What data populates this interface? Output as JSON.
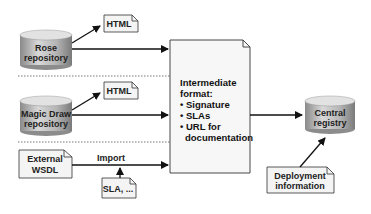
{
  "diagram": {
    "sources": [
      {
        "id": "rose",
        "line1": "Rose",
        "line2": "repository",
        "doc": "HTML"
      },
      {
        "id": "magicdraw",
        "line1": "Magic Draw",
        "line2": "repository",
        "doc": "HTML"
      },
      {
        "id": "external",
        "line1": "External",
        "line2": "WSDL"
      }
    ],
    "import_label": "Import",
    "sla_doc": "SLA, ...",
    "intermediate": {
      "title1": "Intermediate",
      "title2": "format:",
      "bullets": [
        "• Signature",
        "• SLAs",
        "• URL for",
        "   documentation"
      ]
    },
    "central": {
      "line1": "Central",
      "line2": "registry"
    },
    "deployment": {
      "line1": "Deployment",
      "line2": "information"
    }
  }
}
